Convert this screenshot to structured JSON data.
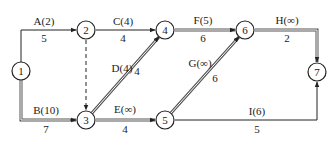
{
  "diagram": {
    "type": "network-flow",
    "nodes": [
      {
        "id": "1",
        "label": "1"
      },
      {
        "id": "2",
        "label": "2"
      },
      {
        "id": "3",
        "label": "3"
      },
      {
        "id": "4",
        "label": "4"
      },
      {
        "id": "5",
        "label": "5"
      },
      {
        "id": "6",
        "label": "6"
      },
      {
        "id": "7",
        "label": "7"
      }
    ],
    "edges": [
      {
        "id": "A",
        "from": "1",
        "to": "2",
        "top": "A(2)",
        "bottom": "5",
        "style": "single"
      },
      {
        "id": "B",
        "from": "1",
        "to": "3",
        "top": "B(10)",
        "bottom": "7",
        "style": "double"
      },
      {
        "id": "C",
        "from": "2",
        "to": "4",
        "top": "C(4)",
        "bottom": "4",
        "style": "single"
      },
      {
        "id": "dummy",
        "from": "2",
        "to": "3",
        "top": "",
        "bottom": "",
        "style": "dashed"
      },
      {
        "id": "D",
        "from": "3",
        "to": "4",
        "top": "D(4)",
        "bottom": "4",
        "style": "double"
      },
      {
        "id": "E",
        "from": "3",
        "to": "5",
        "top": "E(∞)",
        "bottom": "4",
        "style": "double"
      },
      {
        "id": "F",
        "from": "4",
        "to": "6",
        "top": "F(5)",
        "bottom": "6",
        "style": "double"
      },
      {
        "id": "G",
        "from": "5",
        "to": "6",
        "top": "G(∞)",
        "bottom": "6",
        "style": "double"
      },
      {
        "id": "H",
        "from": "6",
        "to": "7",
        "top": "H(∞)",
        "bottom": "2",
        "style": "double"
      },
      {
        "id": "I",
        "from": "5",
        "to": "7",
        "top": "I(6)",
        "bottom": "5",
        "style": "single"
      }
    ]
  }
}
